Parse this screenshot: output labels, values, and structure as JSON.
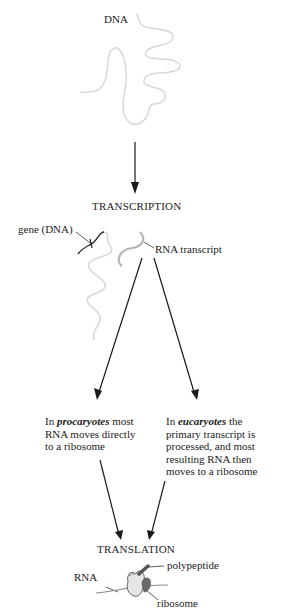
{
  "labels": {
    "dna": "DNA",
    "transcription": "TRANSCRIPTION",
    "gene_dna": "gene (DNA)",
    "rna_transcript": "RNA transcript",
    "translation": "TRANSLATION",
    "rna": "RNA",
    "polypeptide": "polypeptide",
    "ribosome": "ribosome"
  },
  "procaryotes": {
    "prefix": "In ",
    "emphasis": "procaryotes",
    "line1_suffix": " most",
    "line2": "RNA moves directly",
    "line3": "to a ribosome"
  },
  "eucaryotes": {
    "prefix": "In ",
    "emphasis": "eucaryotes",
    "line1_suffix": " the",
    "line2": "primary transcript is",
    "line3": "processed, and most",
    "line4": "resulting RNA then",
    "line5": "moves to a ribosome"
  },
  "colors": {
    "dna_strand": "#d6d6d6",
    "rna_strand": "#b5b5b5",
    "arrow": "#1a1a1a",
    "ribosome_light": "#e6e6e6",
    "ribosome_dark": "#6b6b6b"
  }
}
